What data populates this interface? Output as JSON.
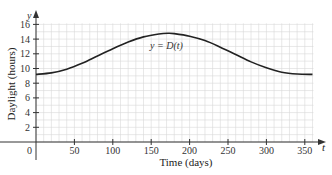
{
  "chart_data": {
    "type": "line",
    "title": "",
    "xlabel": "Time (days)",
    "ylabel": "Daylight (hours)",
    "x_axis_symbol": "t",
    "y_axis_symbol": "y",
    "origin_label": "0",
    "curve_label": "y = D(t)",
    "xlim": [
      0,
      360
    ],
    "ylim": [
      0,
      16
    ],
    "x_ticks": [
      50,
      100,
      150,
      200,
      250,
      300,
      350
    ],
    "y_ticks": [
      2,
      4,
      6,
      8,
      10,
      12,
      14,
      16
    ],
    "grid": true,
    "grid_minor_x_step": 10,
    "grid_minor_y_step": 1,
    "legend": "none",
    "series": [
      {
        "name": "D(t)",
        "x": [
          0,
          20,
          40,
          60,
          80,
          100,
          120,
          140,
          160,
          172,
          180,
          200,
          220,
          240,
          260,
          280,
          300,
          320,
          340,
          360
        ],
        "values": [
          9.2,
          9.4,
          9.9,
          10.7,
          11.7,
          12.7,
          13.6,
          14.3,
          14.7,
          14.8,
          14.75,
          14.4,
          13.8,
          12.9,
          11.9,
          10.9,
          10.1,
          9.5,
          9.25,
          9.2
        ]
      }
    ]
  },
  "colors": {
    "grid": "#d8d8d8",
    "axis": "#333333",
    "curve": "#222222"
  }
}
